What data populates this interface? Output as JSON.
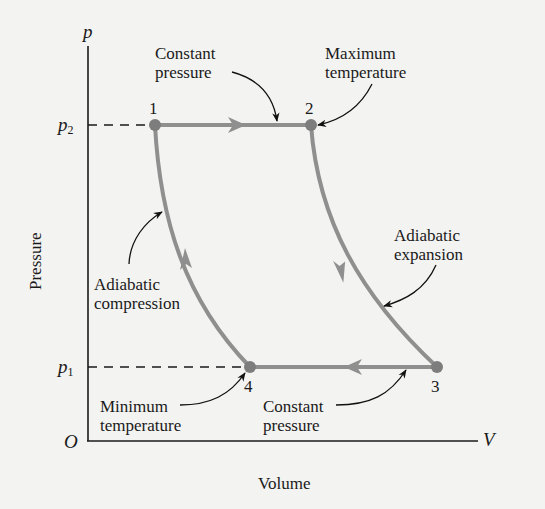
{
  "diagram": {
    "type": "pV diagram (Brayton cycle)",
    "axes": {
      "y_symbol": "p",
      "x_symbol": "V",
      "origin": "O",
      "y_title": "Pressure",
      "x_title": "Volume",
      "y_ticks": [
        {
          "symbol": "p",
          "sub": "2"
        },
        {
          "symbol": "p",
          "sub": "1"
        }
      ]
    },
    "points": [
      {
        "id": "1",
        "label": "1"
      },
      {
        "id": "2",
        "label": "2"
      },
      {
        "id": "3",
        "label": "3"
      },
      {
        "id": "4",
        "label": "4"
      }
    ],
    "annotations": {
      "top_constant_pressure": [
        "Constant",
        "pressure"
      ],
      "maximum_temperature": [
        "Maximum",
        "temperature"
      ],
      "adiabatic_expansion": [
        "Adiabatic",
        "expansion"
      ],
      "adiabatic_compression": [
        "Adiabatic",
        "compression"
      ],
      "minimum_temperature": [
        "Minimum",
        "temperature"
      ],
      "bottom_constant_pressure": [
        "Constant",
        "pressure"
      ]
    },
    "processes": [
      {
        "from": "1",
        "to": "2",
        "kind": "Constant pressure"
      },
      {
        "from": "2",
        "to": "3",
        "kind": "Adiabatic expansion"
      },
      {
        "from": "3",
        "to": "4",
        "kind": "Constant pressure"
      },
      {
        "from": "4",
        "to": "1",
        "kind": "Adiabatic compression"
      }
    ],
    "colors": {
      "cycle": "#8f8f8f",
      "axis": "#1a1a1a",
      "background": "#f3f3f1"
    }
  }
}
